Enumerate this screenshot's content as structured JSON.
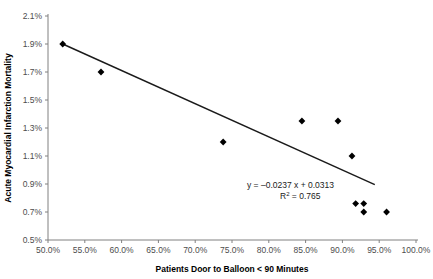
{
  "chart_data": {
    "type": "scatter",
    "title": "",
    "xlabel": "Patients Door to Balloon < 90 Minutes",
    "ylabel": "Acute Myocardial Infarction Mortality",
    "xlim": [
      50.0,
      100.0
    ],
    "ylim": [
      0.5,
      2.1
    ],
    "x_tick_labels": [
      "50.0%",
      "55.0%",
      "60.0%",
      "65.0%",
      "70.0%",
      "75.0%",
      "80.0%",
      "85.0%",
      "90.0%",
      "95.0%",
      "100.0%"
    ],
    "x_tick_values": [
      50,
      55,
      60,
      65,
      70,
      75,
      80,
      85,
      90,
      95,
      100
    ],
    "y_tick_labels": [
      "0.5%",
      "0.7%",
      "0.9%",
      "1.1%",
      "1.3%",
      "1.5%",
      "1.7%",
      "1.9%",
      "2.1%"
    ],
    "y_tick_values": [
      0.5,
      0.7,
      0.9,
      1.1,
      1.3,
      1.5,
      1.7,
      1.9,
      2.1
    ],
    "grid": false,
    "legend": false,
    "units": "percent",
    "marker": "diamond",
    "marker_color": "#000000",
    "trendline_color": "#1a1a1a",
    "points": [
      {
        "x": 52.0,
        "y": 1.9
      },
      {
        "x": 57.2,
        "y": 1.7
      },
      {
        "x": 73.8,
        "y": 1.2
      },
      {
        "x": 84.5,
        "y": 1.35
      },
      {
        "x": 89.4,
        "y": 1.35
      },
      {
        "x": 91.3,
        "y": 1.1
      },
      {
        "x": 91.8,
        "y": 0.76
      },
      {
        "x": 92.9,
        "y": 0.76
      },
      {
        "x": 92.9,
        "y": 0.7
      },
      {
        "x": 96.0,
        "y": 0.7
      }
    ],
    "trendline": {
      "slope_label": "-0.0237",
      "intercept_label": "0.0313",
      "x_start": 52.0,
      "y_start": 1.9,
      "x_end": 94.4,
      "y_end": 0.895
    },
    "annotations": {
      "equation_prefix": "y = ",
      "equation": "y = –0.0237  x + 0.0313",
      "r_squared_label": "R",
      "r_squared_exponent": "2",
      "r_squared_value": " = 0.765"
    }
  },
  "colors": {
    "background": "#ffffff",
    "axis": "#808080",
    "text": "#000000",
    "tick_text": "#4d4d4d",
    "marker": "#000000",
    "trendline": "#1a1a1a"
  }
}
